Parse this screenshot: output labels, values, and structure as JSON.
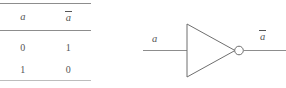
{
  "figure": {
    "kind": "not-gate-truth-table-and-symbol"
  },
  "truth_table": {
    "headers": [
      "a",
      "ā"
    ],
    "header_plain": [
      "a",
      "a"
    ],
    "rows": [
      [
        "0",
        "1"
      ],
      [
        "1",
        "0"
      ]
    ]
  },
  "gate": {
    "type": "NOT",
    "input_label": "a",
    "output_label": "a",
    "output_label_overbar": true,
    "colors": {
      "line": "#8d8d8d",
      "outline": "#6f6f6f",
      "text": "#555555",
      "background": "#ffffff"
    }
  }
}
